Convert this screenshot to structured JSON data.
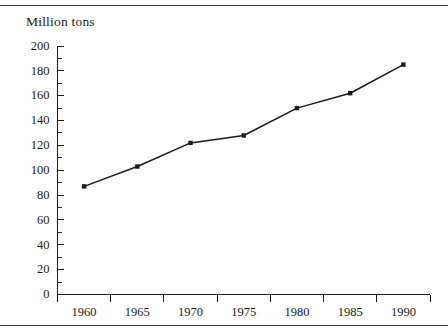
{
  "figure": {
    "background_color": "#ffffff",
    "ink_color": "#1a1a1a",
    "rule_color": "#3a3a3a",
    "top_rule_label": "top-horizontal-rule",
    "bottom_rule_label": "bottom-horizontal-rule"
  },
  "chart_data": {
    "type": "line",
    "title": "",
    "ylabel": "Million tons",
    "xlabel": "",
    "categories": [
      "1960",
      "1965",
      "1970",
      "1975",
      "1980",
      "1985",
      "1990"
    ],
    "x": [
      1960,
      1965,
      1970,
      1975,
      1980,
      1985,
      1990
    ],
    "values": [
      87,
      103,
      122,
      128,
      150,
      162,
      185
    ],
    "series": [
      {
        "name": "Million tons",
        "values": [
          87,
          103,
          122,
          128,
          150,
          162,
          185
        ],
        "line_color": "#1a1a1a",
        "marker": "square",
        "marker_color": "#1a1a1a"
      }
    ],
    "ylim": [
      0,
      200
    ],
    "ytick_labels": [
      "0",
      "20",
      "40",
      "60",
      "80",
      "100",
      "120",
      "140",
      "160",
      "180",
      "200"
    ],
    "yticks": [
      0,
      20,
      40,
      60,
      80,
      100,
      120,
      140,
      160,
      180,
      200
    ],
    "yminor_step": 10,
    "xtick_labels": [
      "1960",
      "1965",
      "1970",
      "1975",
      "1980",
      "1985",
      "1990"
    ],
    "grid": false,
    "legend": false,
    "legend_position": "none"
  }
}
